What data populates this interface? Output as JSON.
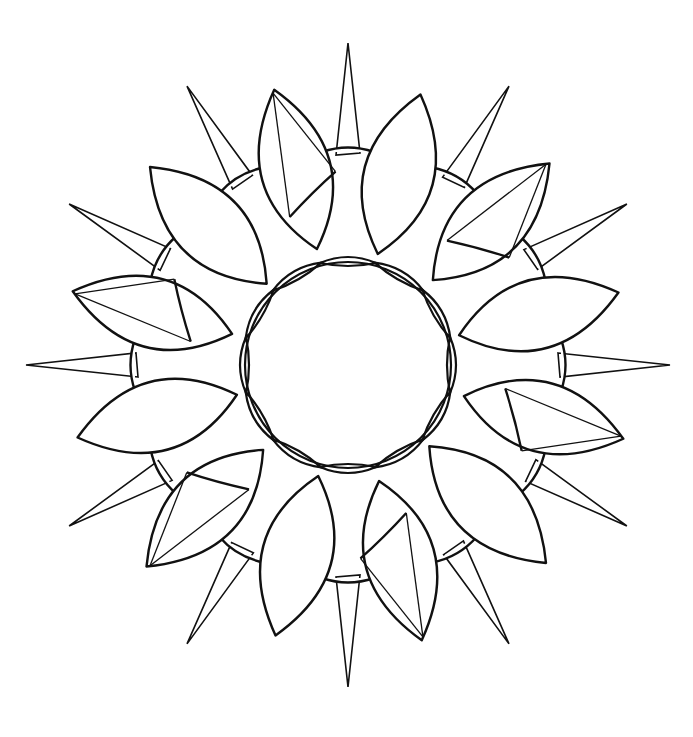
{
  "artwork": {
    "type": "mandala line-art coloring page",
    "background_color": "#ffffff",
    "line_color": "#111111",
    "center": [
      348,
      365
    ],
    "spike_count": 12,
    "petal_count": 12,
    "plain_petal_count": 6,
    "triangulated_petal_count": 6,
    "inner_ring_lens_count": 12
  }
}
